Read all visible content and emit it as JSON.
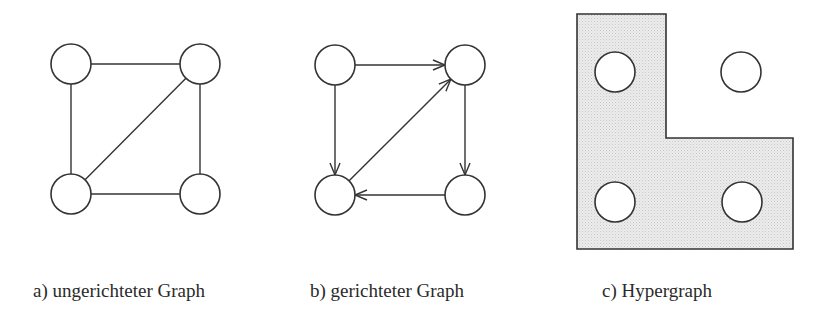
{
  "panels": [
    {
      "id": "a",
      "caption": "a) ungerichteter Graph",
      "type": "undirected",
      "nodes": [
        {
          "id": "tl",
          "cx": 71,
          "cy": 64
        },
        {
          "id": "tr",
          "cx": 200,
          "cy": 64
        },
        {
          "id": "bl",
          "cx": 71,
          "cy": 194
        },
        {
          "id": "br",
          "cx": 200,
          "cy": 194
        }
      ],
      "edges": [
        [
          "tl",
          "tr"
        ],
        [
          "tl",
          "bl"
        ],
        [
          "tr",
          "br"
        ],
        [
          "bl",
          "br"
        ],
        [
          "bl",
          "tr"
        ]
      ]
    },
    {
      "id": "b",
      "caption": "b) gerichteter Graph",
      "type": "directed",
      "nodes": [
        {
          "id": "tl",
          "cx": 335,
          "cy": 65
        },
        {
          "id": "tr",
          "cx": 465,
          "cy": 65
        },
        {
          "id": "bl",
          "cx": 335,
          "cy": 195
        },
        {
          "id": "br",
          "cx": 465,
          "cy": 195
        }
      ],
      "edges": [
        [
          "tl",
          "tr"
        ],
        [
          "tl",
          "bl"
        ],
        [
          "bl",
          "tr"
        ],
        [
          "tr",
          "br"
        ],
        [
          "br",
          "bl"
        ]
      ]
    },
    {
      "id": "c",
      "caption": "c) Hypergraph",
      "type": "hypergraph",
      "nodes": [
        {
          "id": "tl",
          "cx": 615,
          "cy": 72
        },
        {
          "id": "tr",
          "cx": 741,
          "cy": 72
        },
        {
          "id": "bl",
          "cx": 615,
          "cy": 202
        },
        {
          "id": "br",
          "cx": 742,
          "cy": 202
        }
      ],
      "hyperedge": {
        "members": [
          "tl",
          "bl",
          "br"
        ],
        "shape": "L",
        "points": [
          [
            577,
            14
          ],
          [
            666,
            14
          ],
          [
            666,
            138
          ],
          [
            793,
            138
          ],
          [
            793,
            249
          ],
          [
            577,
            249
          ]
        ],
        "fill": "#e6e6e6"
      }
    }
  ],
  "style": {
    "node_radius": 20,
    "stroke": "#333333",
    "node_fill": "#ffffff"
  }
}
